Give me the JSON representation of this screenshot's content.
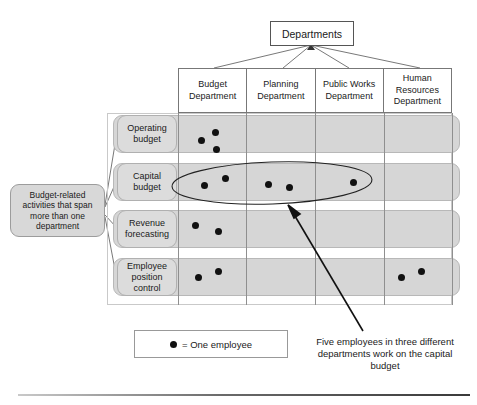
{
  "diagram": {
    "title_box": {
      "label": "Departments"
    },
    "columns": [
      {
        "id": "budget",
        "label": "Budget Department"
      },
      {
        "id": "planning",
        "label": "Planning Department"
      },
      {
        "id": "public-works",
        "label": "Public Works Department"
      },
      {
        "id": "human-resources",
        "label": "Human Resources Department"
      }
    ],
    "rows": [
      {
        "id": "operating-budget",
        "label": "Operating budget"
      },
      {
        "id": "capital-budget",
        "label": "Capital budget"
      },
      {
        "id": "revenue-forecasting",
        "label": "Revenue forecasting"
      },
      {
        "id": "employee-position-control",
        "label": "Employee position control"
      }
    ],
    "left_callout": {
      "text": "Budget-related activities that span more than one department"
    },
    "legend": {
      "symbol": "filled-circle",
      "text": "= One employee"
    },
    "annotation": {
      "text": "Five employees in three different departments work on the capital budget"
    },
    "highlight": {
      "shape": "ellipse",
      "encloses_row": "capital-budget",
      "employee_count": 5,
      "department_count": 3
    },
    "colors": {
      "row_fill": "#d6d6d6",
      "label_fill": "#dcdcdc",
      "dot": "#111111",
      "line": "#555555",
      "frame": "#c9c9c9"
    },
    "employee_dots": {
      "operating-budget": {
        "budget": [
          {
            "x": 201,
            "y": 140
          },
          {
            "x": 215,
            "y": 132
          },
          {
            "x": 216,
            "y": 149
          }
        ],
        "planning": [],
        "public-works": [],
        "human-resources": []
      },
      "capital-budget": {
        "budget": [
          {
            "x": 204,
            "y": 185
          },
          {
            "x": 225,
            "y": 178
          }
        ],
        "planning": [
          {
            "x": 268,
            "y": 184
          },
          {
            "x": 289,
            "y": 187
          }
        ],
        "public-works": [
          {
            "x": 353,
            "y": 182
          }
        ],
        "human-resources": []
      },
      "revenue-forecasting": {
        "budget": [
          {
            "x": 195,
            "y": 225
          },
          {
            "x": 218,
            "y": 231
          }
        ],
        "planning": [],
        "public-works": [],
        "human-resources": []
      },
      "employee-position-control": {
        "budget": [
          {
            "x": 198,
            "y": 277
          },
          {
            "x": 218,
            "y": 271
          }
        ],
        "planning": [],
        "public-works": [],
        "human-resources": [
          {
            "x": 401,
            "y": 277
          },
          {
            "x": 421,
            "y": 271
          }
        ]
      }
    }
  }
}
